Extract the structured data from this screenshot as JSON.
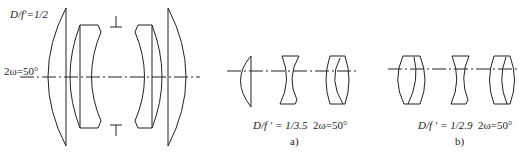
{
  "figure": {
    "main": {
      "aperture_label": "D/f′=1/2",
      "field_label": "2ω=50°",
      "stop_marker_top": "⊥",
      "stop_marker_bottom": "T"
    },
    "panel_a": {
      "aperture_label": "D/f ′ = 1/3.5",
      "field_label": "2ω=50°",
      "caption": "a)"
    },
    "panel_b": {
      "aperture_label": "D/f ′ = 1/2.9",
      "field_label": "2ω=50°",
      "caption": "b)"
    },
    "colors": {
      "line": "#222222",
      "background": "#ffffff"
    }
  }
}
